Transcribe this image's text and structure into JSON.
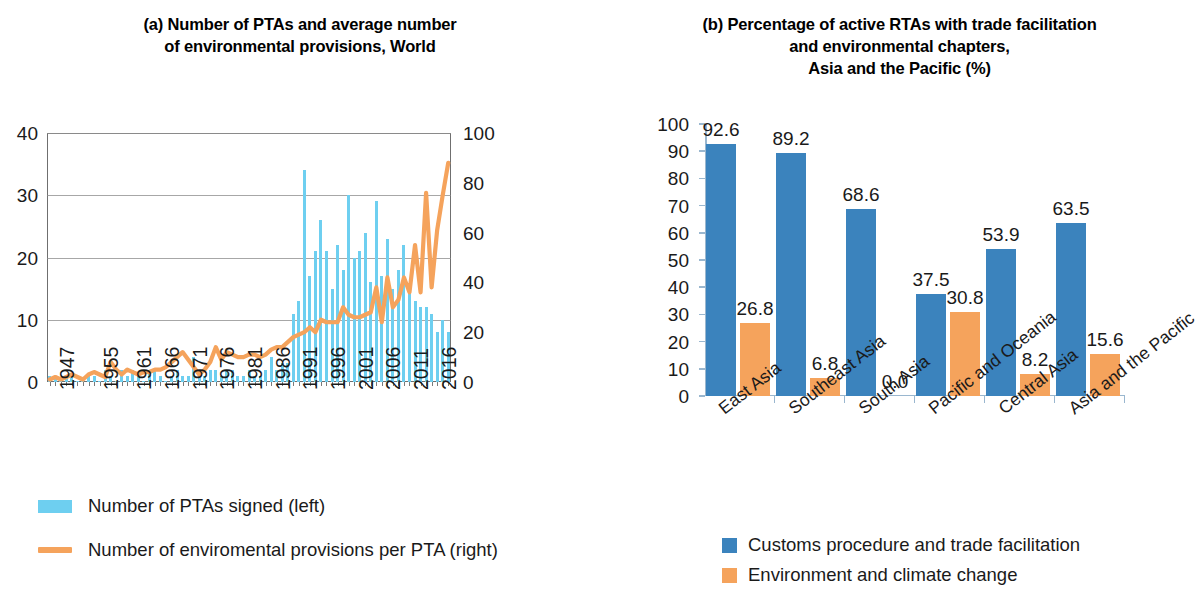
{
  "panel_a": {
    "title_line1": "(a) Number of PTAs and average number",
    "title_line2": "of environmental provisions, World",
    "legend": {
      "bars": "Number of PTAs signed (left)",
      "line": "Number of enviromental provisions per PTA (right)"
    },
    "colors": {
      "bars": "#6ecff0",
      "line": "#f5a35c"
    }
  },
  "panel_b": {
    "title_line1": "(b) Percentage of active RTAs with trade facilitation",
    "title_line2": "and environmental chapters,",
    "title_line3": "Asia and the Pacific (%)",
    "legend": {
      "blue": "Customs procedure and trade facilitation",
      "orange": "Environment and climate change"
    },
    "colors": {
      "blue": "#3b83bd",
      "orange": "#f5a35c"
    }
  },
  "chart_data": [
    {
      "type": "bar",
      "id": "panel_a",
      "title": "(a) Number of PTAs and average number of environmental provisions, World",
      "xlabel": "",
      "ylabel_left": "Number of PTAs signed (left)",
      "ylabel_right": "Number of enviromental provisions per PTA (right)",
      "ylim_left": [
        0,
        40
      ],
      "ylim_right": [
        0,
        100
      ],
      "yticks_left": [
        0,
        10,
        20,
        30,
        40
      ],
      "yticks_right": [
        0,
        20,
        40,
        60,
        80,
        100
      ],
      "grid": true,
      "legend_position": "below",
      "xtick_labels": [
        "1947",
        "1955",
        "1961",
        "1966",
        "1971",
        "1976",
        "1981",
        "1986",
        "1991",
        "1996",
        "2001",
        "2006",
        "2011",
        "2016"
      ],
      "xtick_years": [
        1947,
        1955,
        1961,
        1966,
        1971,
        1976,
        1981,
        1986,
        1991,
        1996,
        2001,
        2006,
        2011,
        2016
      ],
      "x": [
        1947,
        1948,
        1949,
        1950,
        1951,
        1952,
        1953,
        1954,
        1955,
        1956,
        1957,
        1958,
        1959,
        1960,
        1961,
        1962,
        1963,
        1964,
        1965,
        1966,
        1967,
        1968,
        1969,
        1970,
        1971,
        1972,
        1973,
        1974,
        1975,
        1976,
        1977,
        1978,
        1979,
        1980,
        1981,
        1982,
        1983,
        1984,
        1985,
        1986,
        1987,
        1988,
        1989,
        1990,
        1991,
        1992,
        1993,
        1994,
        1995,
        1996,
        1997,
        1998,
        1999,
        2000,
        2001,
        2002,
        2003,
        2004,
        2005,
        2006,
        2007,
        2008,
        2009,
        2010,
        2011,
        2012,
        2013,
        2014,
        2015,
        2016,
        2017,
        2018,
        2019
      ],
      "series": [
        {
          "name": "Number of PTAs signed (left)",
          "axis": "left",
          "type": "bar",
          "color": "#6ecff0",
          "values": [
            1,
            1,
            0,
            1,
            1,
            0,
            0,
            1,
            1,
            0,
            2,
            1,
            0,
            2,
            1,
            2,
            1,
            0,
            2,
            2,
            1,
            0,
            1,
            2,
            1,
            1,
            4,
            1,
            1,
            2,
            2,
            1,
            2,
            2,
            1,
            1,
            2,
            1,
            1,
            2,
            4,
            2,
            3,
            3,
            11,
            13,
            34,
            17,
            21,
            26,
            21,
            15,
            22,
            18,
            30,
            20,
            21,
            24,
            16,
            29,
            17,
            23,
            15,
            18,
            22,
            15,
            13,
            12,
            12,
            11,
            8,
            10,
            8
          ]
        },
        {
          "name": "Number of enviromental provisions per PTA (right)",
          "axis": "right",
          "type": "line",
          "color": "#f5a35c",
          "values": [
            1,
            2,
            1,
            2,
            3,
            2,
            1,
            3,
            4,
            3,
            2,
            8,
            5,
            3,
            5,
            4,
            3,
            4,
            4,
            5,
            5,
            6,
            8,
            10,
            12,
            9,
            6,
            3,
            5,
            8,
            14,
            9,
            12,
            11,
            10,
            10,
            11,
            11,
            10,
            11,
            13,
            14,
            14,
            16,
            18,
            19,
            20,
            22,
            20,
            25,
            24,
            24,
            24,
            30,
            27,
            26,
            26,
            27,
            28,
            38,
            24,
            42,
            30,
            33,
            42,
            36,
            55,
            36,
            76,
            38,
            61,
            75,
            88
          ]
        }
      ]
    },
    {
      "type": "bar",
      "id": "panel_b",
      "title": "(b) Percentage of active RTAs with trade facilitation and environmental chapters, Asia and the Pacific (%)",
      "xlabel": "",
      "ylabel": "",
      "ylim": [
        0,
        100
      ],
      "yticks": [
        0,
        10,
        20,
        30,
        40,
        50,
        60,
        70,
        80,
        90,
        100
      ],
      "grid": false,
      "legend_position": "below",
      "categories": [
        "East Asia",
        "Southeast Asia",
        "South Asia",
        "Pacific and Oceania",
        "Central Asia",
        "Asia and the Pacific"
      ],
      "series": [
        {
          "name": "Customs procedure and trade facilitation",
          "color": "#3b83bd",
          "values": [
            92.6,
            89.2,
            68.6,
            37.5,
            53.9,
            63.5
          ],
          "labels": [
            "92.6",
            "89.2",
            "68.6",
            "37.5",
            "53.9",
            "63.5"
          ]
        },
        {
          "name": "Environment and climate change",
          "color": "#f5a35c",
          "values": [
            26.8,
            6.8,
            0.0,
            30.8,
            8.2,
            15.6
          ],
          "labels": [
            "26.8",
            "6.8",
            "0.0",
            "30.8",
            "8.2",
            "15.6"
          ]
        }
      ]
    }
  ]
}
